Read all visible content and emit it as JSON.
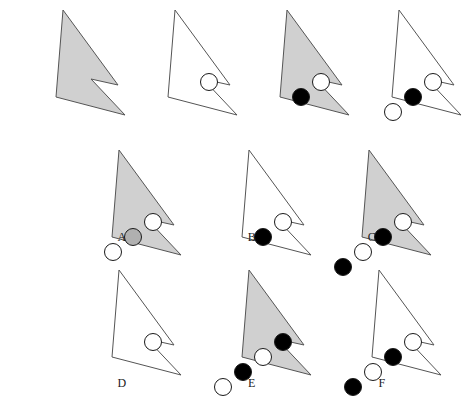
{
  "page": {
    "background_color": "#ffffff",
    "width": 470,
    "height": 417
  },
  "palette": {
    "shape_gray_fill": "#d0d0d0",
    "shape_white_fill": "#ffffff",
    "outline": "#555555",
    "circle_black_fill": "#000000",
    "circle_white_fill": "#ffffff",
    "circle_gray_fill": "#b0b0b0",
    "circle_outline": "#1a1a1a",
    "label_color": "#1a1a1a"
  },
  "shape": {
    "name": "arrow-polygon",
    "polygon_points": "57,8 112,83 85,77 119,113 50,95",
    "circle_radius": 8.5
  },
  "stimuli": {
    "row_label": "problem-row",
    "items": [
      {
        "id": "stim-1",
        "position": 1,
        "shape_fill": "gray",
        "circles": []
      },
      {
        "id": "stim-2",
        "position": 2,
        "shape_fill": "white",
        "circles": [
          {
            "fill": "white",
            "cx": 91,
            "cy": 80
          }
        ]
      },
      {
        "id": "stim-3",
        "position": 3,
        "shape_fill": "gray",
        "circles": [
          {
            "fill": "white",
            "cx": 91,
            "cy": 80
          },
          {
            "fill": "black",
            "cx": 71,
            "cy": 95
          }
        ]
      },
      {
        "id": "stim-4",
        "position": 4,
        "shape_fill": "white",
        "circles": [
          {
            "fill": "white",
            "cx": 91,
            "cy": 80
          },
          {
            "fill": "black",
            "cx": 71,
            "cy": 95
          },
          {
            "fill": "white",
            "cx": 51,
            "cy": 110
          }
        ]
      }
    ]
  },
  "options": {
    "row_labels": [
      "A",
      "B",
      "C",
      "D",
      "E",
      "F"
    ],
    "items": [
      {
        "id": "option-a",
        "label": "A",
        "shape_fill": "gray",
        "circles": [
          {
            "fill": "white",
            "cx": 91,
            "cy": 80
          },
          {
            "fill": "gray",
            "cx": 71,
            "cy": 95
          },
          {
            "fill": "white",
            "cx": 51,
            "cy": 110
          }
        ]
      },
      {
        "id": "option-b",
        "label": "B",
        "shape_fill": "white",
        "circles": [
          {
            "fill": "white",
            "cx": 91,
            "cy": 80
          },
          {
            "fill": "black",
            "cx": 71,
            "cy": 95
          }
        ]
      },
      {
        "id": "option-c",
        "label": "C",
        "shape_fill": "gray",
        "circles": [
          {
            "fill": "white",
            "cx": 91,
            "cy": 80
          },
          {
            "fill": "black",
            "cx": 71,
            "cy": 95
          },
          {
            "fill": "white",
            "cx": 51,
            "cy": 110
          },
          {
            "fill": "black",
            "cx": 31,
            "cy": 125
          }
        ]
      },
      {
        "id": "option-d",
        "label": "D",
        "shape_fill": "white",
        "circles": [
          {
            "fill": "white",
            "cx": 91,
            "cy": 80
          }
        ]
      },
      {
        "id": "option-e",
        "label": "E",
        "shape_fill": "gray",
        "circles": [
          {
            "fill": "black",
            "cx": 91,
            "cy": 80
          },
          {
            "fill": "white",
            "cx": 71,
            "cy": 95
          },
          {
            "fill": "black",
            "cx": 51,
            "cy": 110
          },
          {
            "fill": "white",
            "cx": 31,
            "cy": 125
          }
        ]
      },
      {
        "id": "option-f",
        "label": "F",
        "shape_fill": "white",
        "circles": [
          {
            "fill": "white",
            "cx": 91,
            "cy": 80
          },
          {
            "fill": "black",
            "cx": 71,
            "cy": 95
          },
          {
            "fill": "white",
            "cx": 51,
            "cy": 110
          },
          {
            "fill": "black",
            "cx": 31,
            "cy": 125
          }
        ]
      }
    ]
  },
  "layout": {
    "stimulus_row": {
      "top": 2,
      "lefts": [
        6,
        118,
        230,
        342
      ]
    },
    "option_row_1": {
      "top": 142,
      "lefts": [
        62,
        192,
        312
      ]
    },
    "option_row_2": {
      "top": 262,
      "lefts": [
        62,
        192,
        322
      ]
    },
    "label_row_1": {
      "top": 230,
      "lefts": [
        112,
        242,
        362
      ]
    },
    "label_row_2": {
      "top": 376,
      "lefts": [
        112,
        242,
        372
      ]
    }
  }
}
